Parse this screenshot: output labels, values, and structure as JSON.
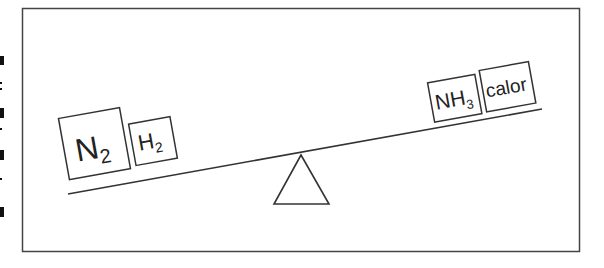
{
  "diagram": {
    "left_pan": {
      "items": [
        {
          "symbol": "N",
          "subscript": "2"
        },
        {
          "symbol": "H",
          "subscript": "2"
        }
      ]
    },
    "right_pan": {
      "items": [
        {
          "symbol": "NH",
          "subscript": "3"
        },
        {
          "symbol": "calor",
          "subscript": ""
        }
      ]
    },
    "fulcrum": "triangle",
    "colors": {
      "stroke": "#333333",
      "background": "#ffffff"
    }
  }
}
